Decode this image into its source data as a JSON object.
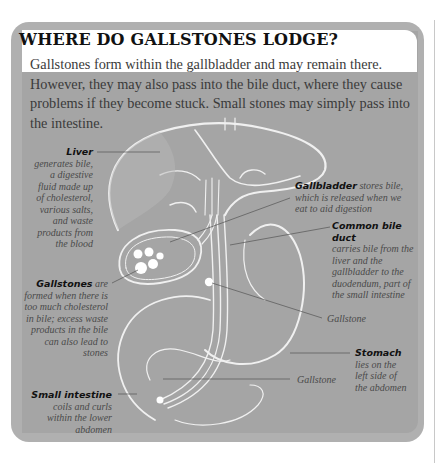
{
  "panel": {
    "title": "WHERE DO GALLSTONES LODGE?",
    "intro": "Gallstones form within the gallbladder and may remain there. However, they may also pass into the bile duct, where they cause problems if they become stuck. Small stones may simply pass into the intestine."
  },
  "labels": {
    "liver": {
      "term": "Liver",
      "text": " generates bile, a digestive fluid made up of cholesterol, various salts, and waste products from the blood"
    },
    "gallbladder": {
      "term": "Gallbladder",
      "text": " stores bile, which is released when we eat to aid digestion"
    },
    "common_bile_duct": {
      "term": "Common bile duct",
      "text": "carries bile from the liver and the gallbladder to the duodendum, part of the small intestine"
    },
    "gallstones": {
      "term": "Gallstones",
      "text": " are formed when there is too much cholesterol in bile; excess waste products in the bile can also lead to stones"
    },
    "gallstone_duct": {
      "text": "Gallstone"
    },
    "stomach": {
      "term": "Stomach",
      "text": " lies on the left side of the abdomen"
    },
    "gallstone_intestine": {
      "text": "Gallstone"
    },
    "small_intestine": {
      "term": "Small intestine",
      "text": " coils and curls within the lower abdomen"
    }
  },
  "colors": {
    "panel_border": "#b0b0b0",
    "panel_fill": "#a5a5a5",
    "outline": "#f2f2f2",
    "leader": "#555555"
  }
}
